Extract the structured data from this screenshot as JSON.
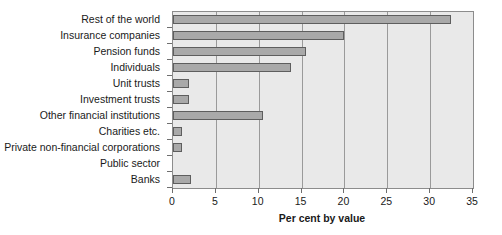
{
  "chart_data": {
    "type": "bar",
    "orientation": "horizontal",
    "title": "",
    "xlabel": "Per cent by value",
    "ylabel": "",
    "xlim": [
      0,
      35
    ],
    "ylim": null,
    "grid": true,
    "legend": null,
    "xticks": [
      0,
      5,
      10,
      15,
      20,
      25,
      30,
      35
    ],
    "xtick_labels": [
      "0",
      "5",
      "10",
      "15",
      "20",
      "25",
      "30",
      "35"
    ],
    "categories": [
      "Rest of the world",
      "Insurance companies",
      "Pension funds",
      "Individuals",
      "Unit trusts",
      "Investment trusts",
      "Other financial institutions",
      "Charities etc.",
      "Private non-financial corporations",
      "Public sector",
      "Banks"
    ],
    "values": [
      32.4,
      20.0,
      15.5,
      13.8,
      1.9,
      1.9,
      10.5,
      1.0,
      1.0,
      0.0,
      2.1
    ],
    "colors": {
      "bar_fill": "#a9a9a9",
      "bar_border": "#5e5e5e",
      "plot_background": "#e9e9e9",
      "gridline": "#9a9a9a",
      "frame": "#8c8c8c",
      "text": "#1a1a1a",
      "page_background": "#ffffff"
    }
  }
}
